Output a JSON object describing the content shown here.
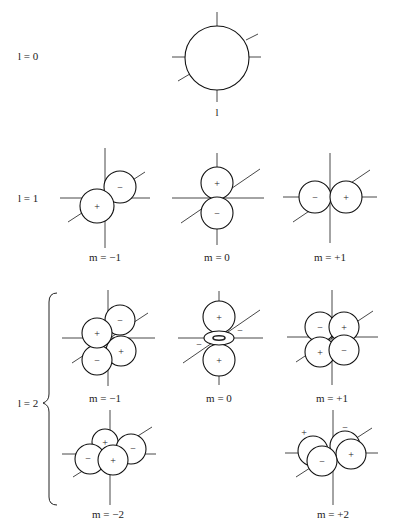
{
  "rows": {
    "l0": {
      "label": "l = 0"
    },
    "l1": {
      "label": "l = 1"
    },
    "l2": {
      "label": "l = 2"
    }
  },
  "captions": {
    "s": "l",
    "p_m_neg1": "m = −1",
    "p_m_0": "m = 0",
    "p_m_pos1": "m = +1",
    "d_m_neg1": "m = −1",
    "d_m_0": "m = 0",
    "d_m_pos1": "m = +1",
    "d_m_neg2": "m = −2",
    "d_m_pos2": "m = +2"
  },
  "signs": {
    "plus": "+",
    "minus": "−"
  }
}
